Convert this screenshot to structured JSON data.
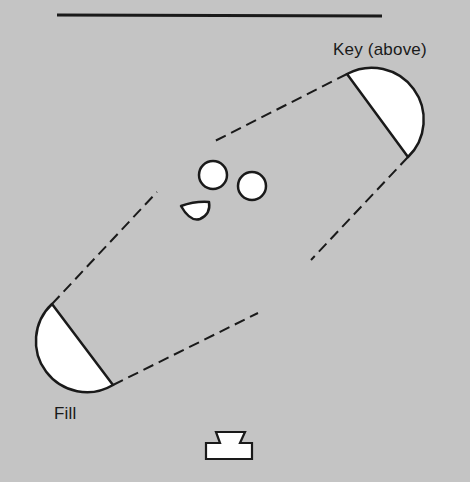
{
  "diagram": {
    "background_color": "#c4c4c4",
    "line_color": "#1a1a1a",
    "fill_color": "#ffffff",
    "labels": {
      "key": "Key (above)",
      "fill": "Fill"
    },
    "elements": [
      {
        "id": "backdrop-line",
        "type": "line",
        "desc": "backdrop / wall"
      },
      {
        "id": "key-light",
        "type": "half-disk",
        "label": "Key (above)"
      },
      {
        "id": "fill-light",
        "type": "half-disk",
        "label": "Fill"
      },
      {
        "id": "subject-head-1",
        "type": "circle"
      },
      {
        "id": "subject-head-2",
        "type": "circle"
      },
      {
        "id": "subject-half",
        "type": "half-circle"
      },
      {
        "id": "camera",
        "type": "camera-symbol"
      }
    ],
    "beams": [
      {
        "from": "key-light",
        "edge": "upper"
      },
      {
        "from": "key-light",
        "edge": "lower"
      },
      {
        "from": "fill-light",
        "edge": "upper"
      },
      {
        "from": "fill-light",
        "edge": "lower"
      }
    ]
  }
}
